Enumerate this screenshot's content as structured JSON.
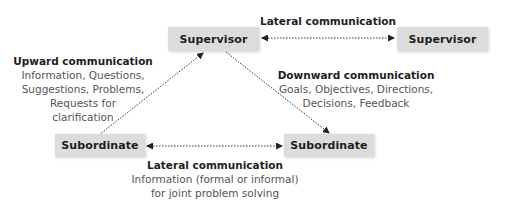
{
  "nodes": {
    "supervisor_left": {
      "label": "Supervisor"
    },
    "supervisor_right": {
      "label": "Supervisor"
    },
    "subordinate_left": {
      "label": "Subordinate"
    },
    "subordinate_right": {
      "label": "Subordinate"
    }
  },
  "edges": {
    "lateral_top": {
      "heading": "Lateral communication",
      "from": "supervisor_left",
      "to": "supervisor_right",
      "direction": "both"
    },
    "upward": {
      "heading": "Upward communication",
      "lines": [
        "Information, Questions,",
        "Suggestions, Problems,",
        "Requests for",
        "clarification"
      ],
      "from": "subordinate_left",
      "to": "supervisor_left",
      "direction": "forward"
    },
    "downward": {
      "heading": "Downward communication",
      "lines": [
        "Goals, Objectives, Directions,",
        "Decisions, Feedback"
      ],
      "from": "supervisor_left",
      "to": "subordinate_right",
      "direction": "forward"
    },
    "lateral_bottom": {
      "heading": "Lateral communication",
      "lines": [
        "Information (formal or informal)",
        "for joint problem solving"
      ],
      "from": "subordinate_left",
      "to": "subordinate_right",
      "direction": "both"
    }
  },
  "colors": {
    "box_fill": "#dcdcdc",
    "heading_text": "#1e1e1e",
    "body_text": "#555555",
    "arrow": "#333333"
  }
}
